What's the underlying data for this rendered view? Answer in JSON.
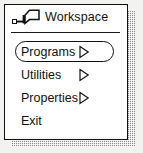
{
  "window": {
    "title": "Workspace",
    "icon": "pushpin-icon",
    "background_color": "#ffffff",
    "border_color": "#111111",
    "shadow_color": "#8a8a8a"
  },
  "menu": {
    "items": [
      {
        "label": "Programs",
        "submenu_arrow": "▷",
        "has_submenu": true,
        "selected": true
      },
      {
        "label": "Utilities",
        "submenu_arrow": "▷",
        "has_submenu": true,
        "selected": false
      },
      {
        "label": "Properties",
        "submenu_arrow": "▷",
        "has_submenu": true,
        "selected": false
      },
      {
        "label": "Exit",
        "submenu_arrow": "",
        "has_submenu": false,
        "selected": false
      }
    ]
  }
}
